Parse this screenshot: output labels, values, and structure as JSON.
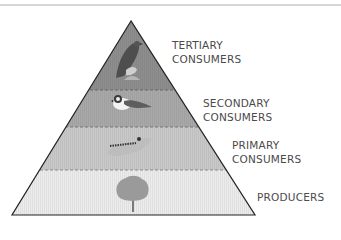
{
  "tiers": [
    {
      "name": "tertiary",
      "line1": "TERTIARY",
      "line2": "CONSUMERS",
      "organism": "hawk",
      "color": "#8e8e8e"
    },
    {
      "name": "secondary",
      "line1": "SECONDARY",
      "line2": "CONSUMERS",
      "organism": "bird",
      "color": "#a9a9a9"
    },
    {
      "name": "primary",
      "line1": "PRIMARY",
      "line2": "CONSUMERS",
      "organism": "caterpillar",
      "color": "#c8c8c8"
    },
    {
      "name": "producers",
      "line1": "PRODUCERS",
      "line2": "",
      "organism": "tree",
      "color": "#ececec"
    }
  ]
}
